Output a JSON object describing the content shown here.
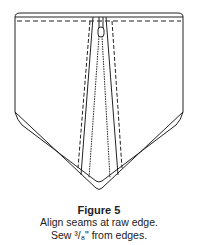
{
  "figure": {
    "title": "Figure 5",
    "instructions": [
      "Align seams at raw edge.",
      "Sew ³/₈\" from edges."
    ],
    "stroke_color": "#222222",
    "background_color": "#ffffff"
  }
}
